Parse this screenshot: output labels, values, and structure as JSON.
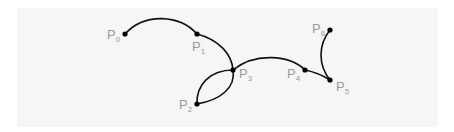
{
  "diagram": {
    "title": "",
    "background": "#f6f6f6",
    "stroke_color": "#111111",
    "label_color": "#9a9a9a",
    "nodes": [
      {
        "id": "P0",
        "base": "P",
        "sub": "0",
        "x": 125,
        "y": 34
      },
      {
        "id": "P1",
        "base": "P",
        "sub": "1",
        "x": 197,
        "y": 34
      },
      {
        "id": "P2",
        "base": "P",
        "sub": "2",
        "x": 197,
        "y": 104
      },
      {
        "id": "P3",
        "base": "P",
        "sub": "3",
        "x": 233,
        "y": 70
      },
      {
        "id": "P4",
        "base": "P",
        "sub": "4",
        "x": 305,
        "y": 70
      },
      {
        "id": "P5",
        "base": "P",
        "sub": "5",
        "x": 330,
        "y": 80
      },
      {
        "id": "P6",
        "base": "P",
        "sub": "6",
        "x": 330,
        "y": 30
      }
    ],
    "edges": [
      {
        "from": "P0",
        "to": "P1",
        "shape": "arc-up"
      },
      {
        "from": "P1",
        "to": "P3",
        "shape": "arc-right"
      },
      {
        "from": "P3",
        "to": "P2",
        "shape": "arc-left-upper"
      },
      {
        "from": "P2",
        "to": "P3",
        "shape": "arc-right-lower"
      },
      {
        "from": "P3",
        "to": "P4",
        "shape": "arc-up"
      },
      {
        "from": "P4",
        "to": "P5",
        "shape": "slight-curve"
      },
      {
        "from": "P5",
        "to": "P6",
        "shape": "arc-left"
      }
    ]
  }
}
